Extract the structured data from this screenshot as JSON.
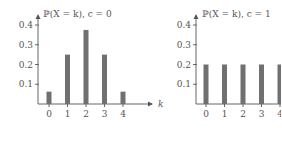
{
  "chart_data": [
    {
      "type": "bar",
      "title": "ℙ(X = k),   c = 0",
      "xlabel": "k",
      "ylabel": "",
      "categories": [
        "0",
        "1",
        "2",
        "3",
        "4"
      ],
      "values": [
        0.0625,
        0.25,
        0.375,
        0.25,
        0.0625
      ],
      "yticks": [
        "0.1",
        "0.2",
        "0.3",
        "0.4"
      ],
      "ylim": [
        0,
        0.42
      ],
      "grid": false,
      "bar_color": "#707070"
    },
    {
      "type": "bar",
      "title": "ℙ(X = k),   c = 1",
      "xlabel": "",
      "ylabel": "",
      "categories": [
        "0",
        "1",
        "2",
        "3",
        "4"
      ],
      "values": [
        0.2,
        0.2,
        0.2,
        0.2,
        0.2
      ],
      "yticks": [
        "0.1",
        "0.2",
        "0.3",
        "0.4"
      ],
      "ylim": [
        0,
        0.42
      ],
      "grid": false,
      "bar_color": "#707070"
    }
  ]
}
